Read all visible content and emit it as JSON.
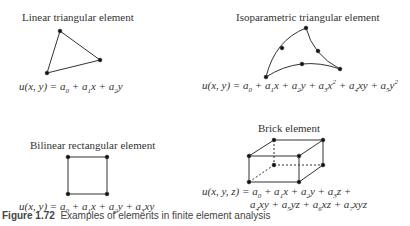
{
  "elements": [
    {
      "label": "Linear triangular element",
      "equation": "u(x, y) = a0 + a1x + a2y"
    },
    {
      "label": "Isoparametric triangular element",
      "equation": "u(x, y) = a0 + a1x + a2y + a3x^2 + a4xy + a5y^2"
    },
    {
      "label": "Bilinear rectangular element",
      "equation": "u(x, y) = a0 + a1x + a2y + a3xy"
    },
    {
      "label": "Brick element",
      "equation_line1": "u(x, y, z) = a0 + a1x + a2y + a3z +",
      "equation_line2": "a4xy + a5yz + a6xz + a7xyz"
    }
  ],
  "caption": {
    "number": "Figure 1.72",
    "text": "Examples of elements in finite element analysis"
  }
}
